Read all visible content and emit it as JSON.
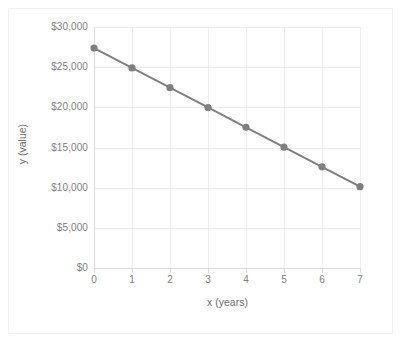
{
  "chart_data": {
    "type": "line",
    "title": "",
    "subtitle": "",
    "xlabel": "x (years)",
    "ylabel": "y (value)",
    "x": [
      0,
      1,
      2,
      3,
      4,
      5,
      6,
      7
    ],
    "values": [
      27375,
      24911,
      22446,
      19982,
      17518,
      15054,
      12589,
      10125
    ],
    "series": [
      {
        "name": "value",
        "values": [
          27375,
          24911,
          22446,
          19982,
          17518,
          15054,
          12589,
          10125
        ]
      }
    ],
    "x_tick_labels": [
      "0",
      "1",
      "2",
      "3",
      "4",
      "5",
      "6",
      "7"
    ],
    "y_tick_labels": [
      "$0",
      "$5,000",
      "$10,000",
      "$15,000",
      "$20,000",
      "$25,000",
      "$30,000"
    ],
    "y_tick_values": [
      0,
      5000,
      10000,
      15000,
      20000,
      25000,
      30000
    ],
    "xlim": [
      0,
      7
    ],
    "ylim": [
      0,
      30000
    ],
    "grid": "both",
    "legend": "none",
    "line_color": "#7f7f7f",
    "marker_color": "#7f7f7f",
    "marker_shape": "circle",
    "grid_color": "#eceded",
    "axis_color": "#d9d9d9",
    "tick_label_color": "#808080",
    "axis_title_color": "#6b6b6b",
    "background_color": "#ffffff"
  },
  "axes": {
    "x_title": "x (years)",
    "y_title": "y (value)"
  }
}
